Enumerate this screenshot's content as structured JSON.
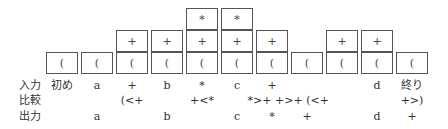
{
  "row_labels": {
    "input": "入力",
    "compare": "比較",
    "output": "出力"
  },
  "stacks": [
    {
      "col": 0,
      "items": [
        "("
      ]
    },
    {
      "col": 1,
      "items": [
        "("
      ]
    },
    {
      "col": 2,
      "items": [
        "(",
        "+"
      ]
    },
    {
      "col": 3,
      "items": [
        "(",
        "+"
      ]
    },
    {
      "col": 4,
      "items": [
        "(",
        "+",
        "*"
      ]
    },
    {
      "col": 5,
      "items": [
        "(",
        "+",
        "*"
      ]
    },
    {
      "col": 6,
      "items": [
        "(",
        "+"
      ]
    },
    {
      "col": 7,
      "items": [
        "("
      ]
    },
    {
      "col": 8,
      "items": [
        "(",
        "+"
      ]
    },
    {
      "col": 9,
      "items": [
        "(",
        "+"
      ]
    },
    {
      "col": 10,
      "items": [
        "("
      ]
    }
  ],
  "input": [
    "初め",
    "a",
    "+",
    "b",
    "*",
    "c",
    "+",
    "",
    "",
    "d",
    "終り"
  ],
  "compare": [
    "",
    "",
    "(<+",
    "",
    "+<*",
    "",
    "*>+ +>+ (<+",
    "",
    "",
    "",
    "+>)"
  ],
  "output": [
    "",
    "a",
    "",
    "b",
    "",
    "c",
    "*",
    "+",
    "",
    "d",
    "+"
  ]
}
